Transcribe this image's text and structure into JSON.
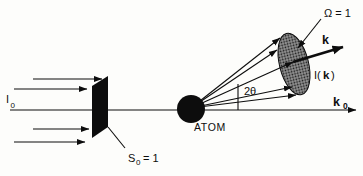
{
  "colors": {
    "bg": "#fdfdfb",
    "ink": "#0d0d0d",
    "halftone-base": "#969696",
    "halftone-dot": "#161616"
  },
  "diagram": {
    "labels": {
      "incident_intensity": {
        "main": "I",
        "sub": "0"
      },
      "slab_area": {
        "main": "S",
        "sub": "0",
        "eq": "= 1"
      },
      "atom": "ATOM",
      "scattering_angle": "2θ",
      "solid_angle": "Ω = 1",
      "k_vector": "k",
      "scattered_intensity": {
        "open": "I(",
        "k": "k",
        "close": ")"
      },
      "k0_vector": {
        "main": "k",
        "sub": "0"
      }
    }
  }
}
